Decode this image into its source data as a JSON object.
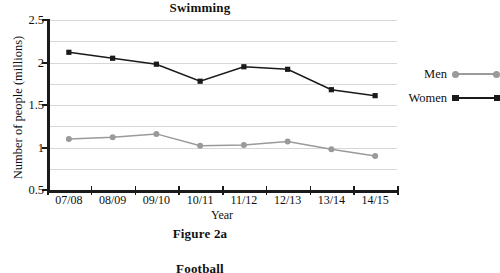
{
  "chart_data": {
    "type": "line",
    "title": "Swimming",
    "xlabel": "Year",
    "ylabel": "Number of people (millions)",
    "categories": [
      "07/08",
      "08/09",
      "09/10",
      "10/11",
      "11/12",
      "12/13",
      "13/14",
      "14/15"
    ],
    "ylim": [
      0.5,
      2.5
    ],
    "ytick_labels": [
      "0.5",
      "1",
      "1.5",
      "2",
      "2.5"
    ],
    "ytick_values": [
      0.5,
      1,
      1.5,
      2,
      2.5
    ],
    "grid": true,
    "gridline_values": [
      0.5,
      0.75,
      1,
      1.25,
      1.5,
      1.75,
      2,
      2.25,
      2.5
    ],
    "legend_position": "right",
    "series": [
      {
        "name": "Men",
        "marker": "circle",
        "color": "#9a9a9a",
        "values": [
          1.1,
          1.12,
          1.16,
          1.02,
          1.03,
          1.07,
          0.98,
          0.9
        ]
      },
      {
        "name": "Women",
        "marker": "square",
        "color": "#1a1a1a",
        "values": [
          2.12,
          2.05,
          1.98,
          1.78,
          1.95,
          1.92,
          1.68,
          1.61
        ]
      }
    ]
  },
  "figure": {
    "caption": "Figure 2a"
  },
  "next_figure": {
    "title": "Football"
  },
  "colors": {
    "men": "#9a9a9a",
    "women": "#1a1a1a",
    "axis": "#1a1a1a",
    "grid": "#d7d7d7"
  }
}
